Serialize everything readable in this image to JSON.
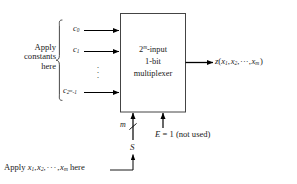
{
  "diagram": {
    "background_color": "#ffffff",
    "line_color": "#000000",
    "text_color": "#1a1a1a",
    "box": {
      "line1": "2",
      "line1_sup": "m",
      "line1_rest": "-input",
      "line2": "1-bit",
      "line3": "multiplexer"
    },
    "left_group_label": {
      "line1": "Apply",
      "line2": "constants",
      "line3": "here"
    },
    "inputs": [
      {
        "name": "c",
        "subscript": "0",
        "label_text": "c0"
      },
      {
        "name": "c",
        "subscript": "1",
        "label_text": "c1"
      },
      {
        "name": "c",
        "subscript": "2^m -1",
        "label_text": "c2m-1"
      }
    ],
    "ellipsis_dots": [
      "·",
      "·",
      "·"
    ],
    "output": {
      "function": "z",
      "args": "(x1, x2, ···, xm )",
      "var1": "x",
      "sub1": "1",
      "var2": "x",
      "sub2": "2",
      "dots": "···",
      "varm": "x",
      "subm": "m"
    },
    "select": {
      "bus_width": "m",
      "signal_name": "S",
      "bottom_note_prefix": "Apply ",
      "bottom_note_vars": "x1, x2, · · · , xm",
      "bottom_note_suffix": " here"
    },
    "enable": {
      "name": "E",
      "equals": "=",
      "value": "1",
      "note": "(not used)"
    }
  }
}
